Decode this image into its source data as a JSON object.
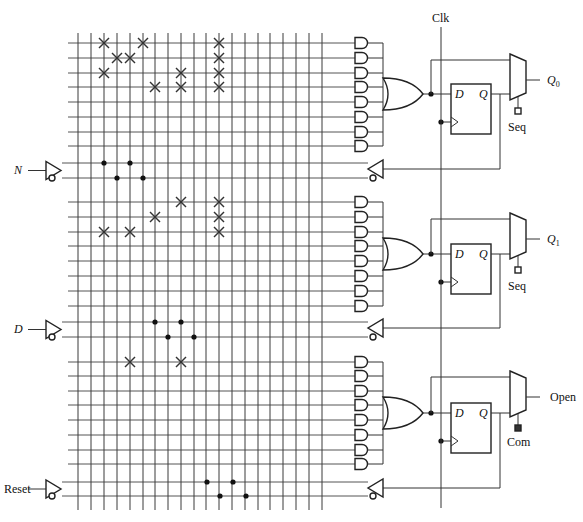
{
  "diagram": {
    "clock_label": "Clk",
    "inputs": [
      {
        "label": "N",
        "italic": true,
        "y_true": 163,
        "y_comp": 178,
        "dots": [
          [
            104,
            163
          ],
          [
            117,
            178
          ],
          [
            130,
            163
          ],
          [
            143,
            178
          ]
        ]
      },
      {
        "label": "D",
        "italic": true,
        "y_true": 322,
        "y_comp": 337,
        "dots": [
          [
            155,
            322
          ],
          [
            168,
            337
          ],
          [
            181,
            322
          ],
          [
            194,
            337
          ]
        ]
      },
      {
        "label": "Reset",
        "italic": false,
        "y_true": 482,
        "y_comp": 496,
        "dots": [
          [
            207,
            482
          ],
          [
            220,
            496
          ],
          [
            233,
            482
          ],
          [
            246,
            496
          ]
        ]
      }
    ],
    "grid": {
      "columns_x": [
        78,
        91,
        104,
        117,
        130,
        143,
        155,
        168,
        181,
        194,
        206,
        219,
        232,
        245,
        258,
        270,
        283,
        296,
        309,
        322
      ],
      "top": 33,
      "bottom": 510,
      "h_line_left": 68,
      "h_line_right": 355
    },
    "macrocells": [
      {
        "output_label": "Q",
        "output_sub": "0",
        "select_label": "Seq",
        "select_filled": false,
        "product_rows": [
          43,
          58,
          73,
          87,
          102,
          117,
          132,
          146
        ],
        "or_out_y": 94,
        "feedback": {
          "y_true": 163,
          "y_comp": 178,
          "buf_y": 169
        },
        "mux_out_y": 80,
        "crosses": [
          [
            104,
            43
          ],
          [
            143,
            43
          ],
          [
            219,
            43
          ],
          [
            117,
            58
          ],
          [
            130,
            58
          ],
          [
            219,
            58
          ],
          [
            104,
            73
          ],
          [
            181,
            73
          ],
          [
            219,
            73
          ],
          [
            155,
            87
          ],
          [
            181,
            87
          ],
          [
            219,
            87
          ]
        ]
      },
      {
        "output_label": "Q",
        "output_sub": "1",
        "select_label": "Seq",
        "select_filled": false,
        "product_rows": [
          202,
          217,
          232,
          246,
          261,
          276,
          291,
          306
        ],
        "or_out_y": 254,
        "feedback": {
          "y_true": 322,
          "y_comp": 337,
          "buf_y": 328
        },
        "mux_out_y": 239,
        "crosses": [
          [
            181,
            202
          ],
          [
            219,
            202
          ],
          [
            155,
            217
          ],
          [
            219,
            217
          ],
          [
            104,
            232
          ],
          [
            130,
            232
          ],
          [
            219,
            232
          ]
        ]
      },
      {
        "output_label": "Open",
        "output_sub": "",
        "select_label": "Com",
        "select_filled": true,
        "product_rows": [
          362,
          376,
          391,
          405,
          420,
          435,
          450,
          464
        ],
        "or_out_y": 413,
        "feedback": {
          "y_true": 482,
          "y_comp": 496,
          "buf_y": 488
        },
        "mux_out_y": 397,
        "crosses": [
          [
            130,
            362
          ],
          [
            181,
            362
          ]
        ]
      }
    ],
    "flipflop": {
      "d_label": "D",
      "q_label": "Q"
    },
    "colors": {
      "line": "#333333",
      "background": "#ffffff"
    }
  }
}
